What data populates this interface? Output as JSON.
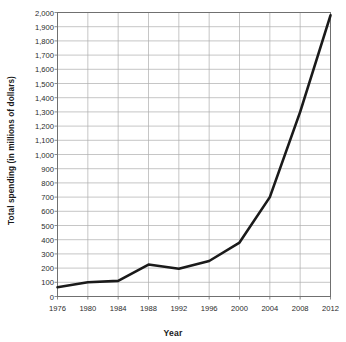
{
  "chart_data": {
    "type": "line",
    "title": "",
    "xlabel": "Year",
    "ylabel": "Total spending (in millions of dollars)",
    "x": [
      1976,
      1980,
      1984,
      1988,
      1992,
      1996,
      2000,
      2004,
      2008,
      2012
    ],
    "values": [
      65,
      100,
      110,
      225,
      195,
      250,
      380,
      700,
      1300,
      1980
    ],
    "series": [
      {
        "name": "Total spending",
        "values": [
          65,
          100,
          110,
          225,
          195,
          250,
          380,
          700,
          1300,
          1980
        ]
      }
    ],
    "xlim": [
      1976,
      2012
    ],
    "ylim": [
      0,
      2000
    ],
    "xticks": [
      "1976",
      "1980",
      "1984",
      "1988",
      "1992",
      "1996",
      "2000",
      "2004",
      "2008",
      "2012"
    ],
    "yticks": [
      "0",
      "100",
      "200",
      "300",
      "400",
      "500",
      "600",
      "700",
      "800",
      "900",
      "1,000",
      "1,100",
      "1,200",
      "1,300",
      "1,400",
      "1,500",
      "1,600",
      "1,700",
      "1,800",
      "1,900",
      "2,000"
    ],
    "grid": true,
    "legend": false,
    "line_color": "#1a1a1a",
    "grid_color": "#aeaeae",
    "axis_color": "#707070",
    "background": "#ffffff"
  }
}
